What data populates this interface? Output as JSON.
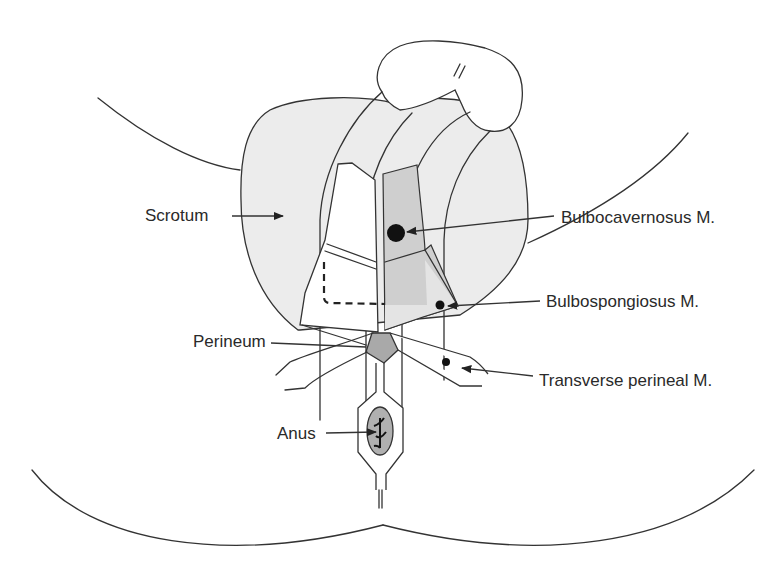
{
  "figure": {
    "type": "anatomical-line-drawing",
    "colors": {
      "line": "#333333",
      "scrotum_fill": "#ececec",
      "muscle_fill": "#cfcfcf",
      "perineum_fill": "#a9a9a9",
      "anus_fill": "#b0b0b0",
      "marker": "#111111"
    }
  },
  "labels": {
    "scrotum": "Scrotum",
    "bulbocavernosus": "Bulbocavernosus M.",
    "bulbospongiosus": "Bulbospongiosus M.",
    "perineum": "Perineum",
    "transverse_perineal": "Transverse perineal M.",
    "anus": "Anus"
  }
}
